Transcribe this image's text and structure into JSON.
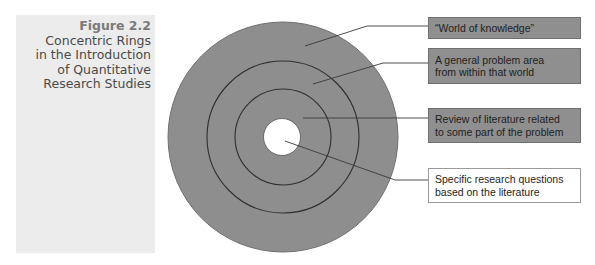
{
  "caption": {
    "label": "Figure 2.2",
    "title_lines": [
      "Concentric Rings",
      "in the Introduction",
      "of Quantitative",
      "Research Studies"
    ]
  },
  "diagram": {
    "type": "concentric-rings",
    "colors": {
      "ring_fill": "#8e8e8e",
      "ring_edge": "#707070",
      "ring_lines": "#2f2f2f",
      "core_fill": "#ffffff",
      "leader_lines": "#3a3a3a",
      "callout_fill": "#8f8f8f",
      "callout_border": "#6f6f6f",
      "panel_bg": "#ececec"
    },
    "rings": [
      {
        "id": "outer",
        "label": "“World of knowledge”"
      },
      {
        "id": "middle",
        "label": "A general problem area from within that world"
      },
      {
        "id": "inner",
        "label": "Review of literature related to some part of the problem"
      },
      {
        "id": "core",
        "label": "Specific research questions based on the literature"
      }
    ],
    "callouts": [
      {
        "lines": [
          "“World of knowledge”"
        ],
        "style": "filled"
      },
      {
        "lines": [
          "A general problem area",
          "from within that world"
        ],
        "style": "filled"
      },
      {
        "lines": [
          "Review of literature related",
          "to some part of the problem"
        ],
        "style": "filled"
      },
      {
        "lines": [
          "Specific research questions",
          "based on the literature"
        ],
        "style": "outline"
      }
    ]
  }
}
